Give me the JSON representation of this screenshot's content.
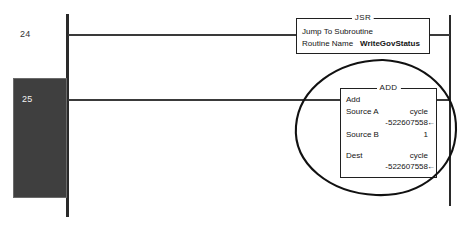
{
  "diagram": {
    "kind": "ladder-logic-rungs",
    "colors": {
      "background": "#ffffff",
      "rail": "#2a2a2a",
      "wire": "#3a3a3a",
      "instruction_border": "#202020",
      "selection_fill": "#3f3f3f",
      "selection_border": "#6a6a6a",
      "selection_text": "#f2f2f2",
      "annotation": "#111111"
    }
  },
  "rungs": [
    {
      "number": "24",
      "instruction": {
        "mnemonic": "JSR",
        "operation_label": "Jump To Subroutine",
        "parameter_label": "Routine Name",
        "parameter_value": "WriteGovStatus"
      }
    },
    {
      "number": "25",
      "selected": true,
      "instruction": {
        "mnemonic": "ADD",
        "operation_label": "Add",
        "operands": [
          {
            "label": "Source A",
            "tag": "cycle",
            "value": "-522607558",
            "live": true
          },
          {
            "label": "Source B",
            "tag": "",
            "value": "1",
            "live": false
          },
          {
            "label": "Dest",
            "tag": "cycle",
            "value": "-522607558",
            "live": true
          }
        ]
      }
    }
  ],
  "annotation": {
    "shape": "hand-drawn-ellipse",
    "target": "ADD instruction block"
  },
  "icons": {
    "live-value-arrow": "←"
  }
}
